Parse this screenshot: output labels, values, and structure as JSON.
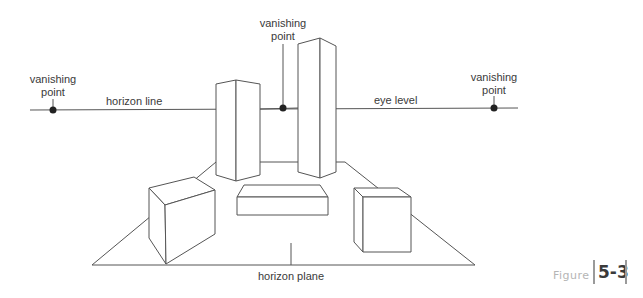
{
  "diagram": {
    "labels": {
      "vp_left_line1": "vanishing",
      "vp_left_line2": "point",
      "vp_center_line1": "vanishing",
      "vp_center_line2": "point",
      "vp_right_line1": "vanishing",
      "vp_right_line2": "point",
      "horizon_line": "horizon line",
      "eye_level": "eye level",
      "horizon_plane": "horizon plane"
    },
    "figure": {
      "word": "Figure",
      "number": "5-3"
    },
    "colors": {
      "line": "#555555",
      "text": "#3a3a3a",
      "figure_word": "#b5b5b5",
      "figure_bar": "#9a9a9a"
    }
  }
}
